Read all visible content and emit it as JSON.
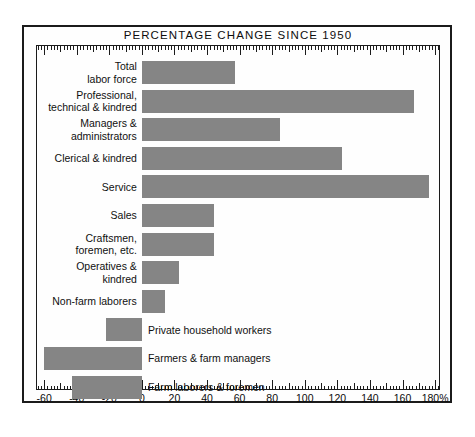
{
  "chart_data": {
    "type": "bar",
    "orientation": "horizontal",
    "title": "PERCENTAGE CHANGE SINCE 1950",
    "xlabel": "",
    "ylabel": "",
    "xlim": [
      -65,
      183
    ],
    "grid": false,
    "legend": null,
    "tick_labels": [
      "-60",
      "-40",
      "-20",
      "0",
      "20",
      "40",
      "60",
      "80",
      "100",
      "120",
      "140",
      "160",
      "180%"
    ],
    "tick_values": [
      -60,
      -40,
      -20,
      0,
      20,
      40,
      60,
      80,
      100,
      120,
      140,
      160,
      180
    ],
    "bar_color": "#858585",
    "frame_color": "#1b1b1b",
    "background": "#ffffff",
    "categories": [
      "Total labor force",
      "Professional, technical & kindred",
      "Managers & administrators",
      "Clerical & kindred",
      "Service",
      "Sales",
      "Craftsmen, foremen, etc.",
      "Operatives & kindred",
      "Non-farm laborers",
      "Private household workers",
      "Farmers & farm managers",
      "Farm laborers & foremen"
    ],
    "values": [
      57,
      167,
      85,
      123,
      176,
      44,
      44,
      23,
      14,
      -22,
      -60,
      -43
    ]
  },
  "rows": [
    {
      "label_lines": [
        "Total",
        "labor force"
      ],
      "value": 57,
      "label_side": "left"
    },
    {
      "label_lines": [
        "Professional,",
        "technical & kindred"
      ],
      "value": 167,
      "label_side": "left"
    },
    {
      "label_lines": [
        "Managers &",
        "administrators"
      ],
      "value": 85,
      "label_side": "left"
    },
    {
      "label_lines": [
        "Clerical & kindred"
      ],
      "value": 123,
      "label_side": "left"
    },
    {
      "label_lines": [
        "Service"
      ],
      "value": 176,
      "label_side": "left"
    },
    {
      "label_lines": [
        "Sales"
      ],
      "value": 44,
      "label_side": "left"
    },
    {
      "label_lines": [
        "Craftsmen,",
        "foremen, etc."
      ],
      "value": 44,
      "label_side": "left"
    },
    {
      "label_lines": [
        "Operatives &",
        "kindred"
      ],
      "value": 23,
      "label_side": "left"
    },
    {
      "label_lines": [
        "Non-farm laborers"
      ],
      "value": 14,
      "label_side": "left"
    },
    {
      "label_lines": [
        "Private household workers"
      ],
      "value": -22,
      "label_side": "right"
    },
    {
      "label_lines": [
        "Farmers & farm managers"
      ],
      "value": -60,
      "label_side": "right"
    },
    {
      "label_lines": [
        "Farm laborers & foremen"
      ],
      "value": -43,
      "label_side": "right"
    }
  ]
}
